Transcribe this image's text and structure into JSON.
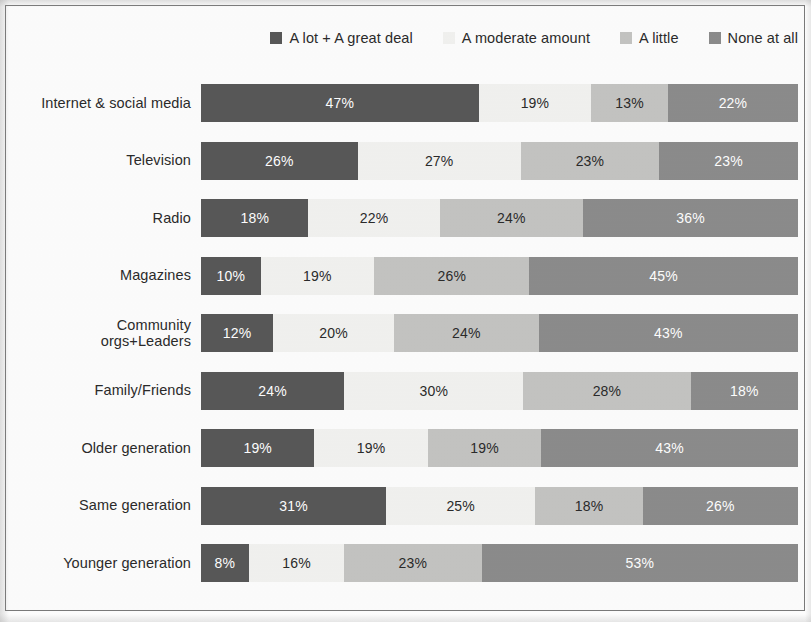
{
  "chart_data": {
    "type": "bar",
    "title": "",
    "subtitle": "",
    "xlabel": "",
    "ylabel": "",
    "orientation": "horizontal",
    "stacked": true,
    "normalized_percent": true,
    "grid": false,
    "legend_position": "top-right",
    "xlim": [
      0,
      100
    ],
    "categories": [
      "Internet & social media",
      "Television",
      "Radio",
      "Magazines",
      "Community orgs+Leaders",
      "Family/Friends",
      "Older generation",
      "Same generation",
      "Younger generation"
    ],
    "series": [
      {
        "name": "A lot + A great deal",
        "color": "#585858",
        "label_color": "#ffffff",
        "values": [
          47,
          26,
          18,
          10,
          12,
          24,
          19,
          31,
          8
        ],
        "labels": [
          "47%",
          "26%",
          "18%",
          "10%",
          "12%",
          "24%",
          "19%",
          "31%",
          "8%"
        ]
      },
      {
        "name": "A moderate amount",
        "color": "#f2f2f0",
        "label_color": "#2b2b2b",
        "values": [
          19,
          27,
          22,
          19,
          20,
          30,
          19,
          25,
          16
        ],
        "labels": [
          "19%",
          "27%",
          "22%",
          "19%",
          "20%",
          "30%",
          "19%",
          "25%",
          "16%"
        ]
      },
      {
        "name": "A little",
        "color": "#c4c4c2",
        "label_color": "#2b2b2b",
        "values": [
          13,
          23,
          24,
          26,
          24,
          28,
          19,
          18,
          23
        ],
        "labels": [
          "13%",
          "23%",
          "24%",
          "26%",
          "24%",
          "28%",
          "19%",
          "18%",
          "23%"
        ]
      },
      {
        "name": "None at all",
        "color": "#8c8c8c",
        "label_color": "#ffffff",
        "values": [
          22,
          23,
          36,
          45,
          43,
          18,
          43,
          26,
          53
        ],
        "labels": [
          "22%",
          "23%",
          "36%",
          "45%",
          "43%",
          "18%",
          "43%",
          "26%",
          "53%"
        ]
      }
    ]
  },
  "legend": {
    "items": [
      {
        "label": "A lot + A great deal",
        "color": "#585858"
      },
      {
        "label": "A moderate amount",
        "color": "#f2f2f0"
      },
      {
        "label": "A little",
        "color": "#c4c4c2"
      },
      {
        "label": "None at all",
        "color": "#8c8c8c"
      }
    ]
  },
  "axis": {
    "category_labels": [
      "Internet & social media",
      "Television",
      "Radio",
      "Magazines",
      "Community orgs+Leaders",
      "Family/Friends",
      "Older generation",
      "Same generation",
      "Younger generation"
    ]
  },
  "style": {
    "border_color": "#7a7a7a",
    "background": "#fdfdfd",
    "text_color": "#2b2b2b"
  }
}
